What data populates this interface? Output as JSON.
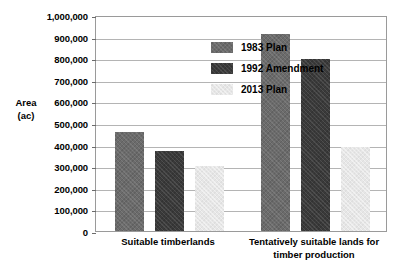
{
  "chart_data": {
    "type": "bar",
    "title": "",
    "xlabel": "",
    "ylabel": "Area\n(ac)",
    "ylabel_lines": [
      "Area",
      "(ac)"
    ],
    "categories": [
      "Suitable timberlands",
      "Tentatively suitable lands for timber production"
    ],
    "category_lines": [
      [
        "Suitable timberlands"
      ],
      [
        "Tentatively suitable lands for",
        "timber production"
      ]
    ],
    "series": [
      {
        "name": "1983 Plan",
        "values": [
          460000,
          910000
        ],
        "color": "#6b6b6b"
      },
      {
        "name": "1992 Amendment",
        "values": [
          370000,
          795000
        ],
        "color": "#3a3a3a"
      },
      {
        "name": "2013 Plan",
        "values": [
          300000,
          390000
        ],
        "color": "#e6e6e6"
      }
    ],
    "ylim": [
      0,
      1000000
    ],
    "ytick_step": 100000,
    "ytick_labels": [
      "1,000,000",
      "900,000",
      "800,000",
      "700,000",
      "600,000",
      "500,000",
      "400,000",
      "300,000",
      "200,000",
      "100,000",
      "0"
    ],
    "ytick_values": [
      1000000,
      900000,
      800000,
      700000,
      600000,
      500000,
      400000,
      300000,
      200000,
      100000,
      0
    ],
    "grid": true,
    "legend_position": "top-left-inside",
    "plot_border_color": "#9a9a9a",
    "gridline_color": "#b4b4b4",
    "background_color": "#ffffff"
  }
}
